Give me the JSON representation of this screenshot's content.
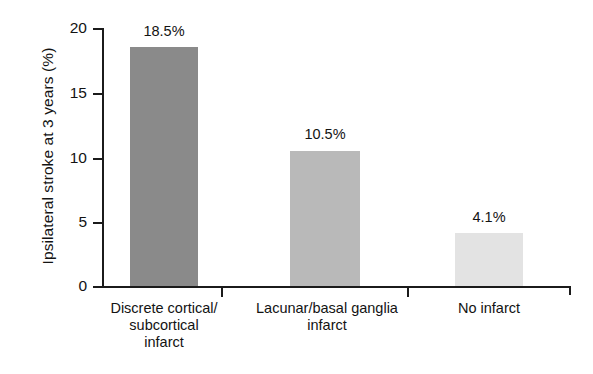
{
  "chart_data": {
    "type": "bar",
    "title": "",
    "subtitle": "",
    "xlabel": "",
    "ylabel": "Ipsilateral stroke at 3 years (%)",
    "ylim": [
      0,
      20
    ],
    "ytick_labels": [
      "0",
      "5",
      "10",
      "15",
      "20"
    ],
    "ytick_values": [
      0,
      5,
      10,
      15,
      20
    ],
    "grid": false,
    "legend": false,
    "legend_position": "none",
    "categories": [
      "Discrete cortical/ subcortical infarct",
      "Lacunar/basal ganglia infarct",
      "No infarct"
    ],
    "category_lines": [
      [
        "Discrete cortical/",
        "subcortical",
        "infarct"
      ],
      [
        "Lacunar/basal ganglia",
        "infarct"
      ],
      [
        "No infarct"
      ]
    ],
    "values": [
      18.5,
      10.5,
      4.1
    ],
    "value_labels": [
      "18.5%",
      "10.5%",
      "4.1%"
    ],
    "bar_colors": [
      "#8a8a8a",
      "#b9b9b9",
      "#e3e3e3"
    ]
  },
  "axis": {
    "line_color": "#1b1b1b"
  }
}
